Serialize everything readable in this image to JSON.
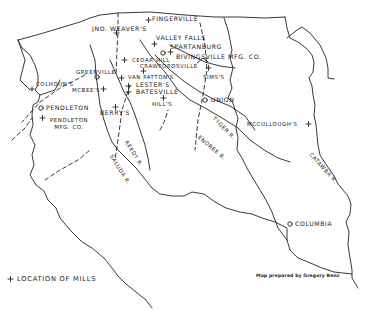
{
  "map": {
    "title": "South Carolina upstate textile mills",
    "mills": [
      {
        "label": "Fingerville"
      },
      {
        "label": "Jno. Weaver's"
      },
      {
        "label": "Valley Falls"
      },
      {
        "label": "Bivingsville Mfg. Co."
      },
      {
        "label": "Cedar Hill"
      },
      {
        "label": "Crawfordsville"
      },
      {
        "label": "Sims's"
      },
      {
        "label": "Van Patton's"
      },
      {
        "label": "Lester's"
      },
      {
        "label": "Batesville"
      },
      {
        "label": "Hill's"
      },
      {
        "label": "Colhoun's"
      },
      {
        "label": "McBee's"
      },
      {
        "label": "Berry's"
      },
      {
        "label": "Pendleton Mfg. Co."
      },
      {
        "label": "McCullough's"
      }
    ],
    "towns": [
      {
        "label": "Spartanburg"
      },
      {
        "label": "Greenville"
      },
      {
        "label": "Union"
      },
      {
        "label": "Pendleton"
      },
      {
        "label": "Columbia"
      }
    ],
    "rivers": [
      {
        "label": "Reedy R."
      },
      {
        "label": "Saluda R."
      },
      {
        "label": "Enoree R."
      },
      {
        "label": "Tyger R."
      },
      {
        "label": "Catawba R."
      }
    ],
    "legend": {
      "symbol": "+",
      "label": "Location of Mills"
    },
    "credit": "Map prepared by Gregory Benz"
  }
}
